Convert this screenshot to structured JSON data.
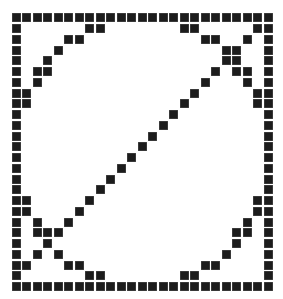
{
  "title": "Pixel grid pattern",
  "grid": {
    "cols": 25,
    "rows": 26,
    "origin_x": 11.7,
    "origin_y": 13.3,
    "pitch_x": 10.5,
    "pitch_y": 10.75,
    "cell_color": "#1c1c1c",
    "background": "#ffffff",
    "filled": [
      [
        0,
        1,
        2,
        3,
        4,
        5,
        6,
        7,
        8,
        9,
        10,
        11,
        12,
        13,
        14,
        15,
        16,
        17,
        18,
        19,
        20,
        21,
        22,
        23,
        24
      ],
      [
        0,
        7,
        8,
        16,
        17,
        23,
        24
      ],
      [
        0,
        5,
        6,
        18,
        19,
        22,
        24
      ],
      [
        0,
        4,
        20,
        21,
        24
      ],
      [
        0,
        3,
        20,
        21,
        24
      ],
      [
        0,
        2,
        3,
        19,
        21,
        22,
        24
      ],
      [
        0,
        2,
        18,
        22,
        24
      ],
      [
        0,
        1,
        17,
        23,
        24
      ],
      [
        0,
        1,
        16,
        23,
        24
      ],
      [
        0,
        15,
        24
      ],
      [
        0,
        14,
        24
      ],
      [
        0,
        13,
        24
      ],
      [
        0,
        12,
        24
      ],
      [
        0,
        11,
        24
      ],
      [
        0,
        10,
        24
      ],
      [
        0,
        9,
        24
      ],
      [
        0,
        8,
        24
      ],
      [
        0,
        1,
        7,
        23,
        24
      ],
      [
        0,
        1,
        6,
        23,
        24
      ],
      [
        0,
        2,
        5,
        22,
        24
      ],
      [
        0,
        2,
        3,
        4,
        21,
        22,
        24
      ],
      [
        0,
        3,
        21,
        24
      ],
      [
        0,
        2,
        4,
        20,
        24
      ],
      [
        0,
        1,
        5,
        6,
        18,
        19,
        24
      ],
      [
        0,
        7,
        8,
        16,
        17,
        24
      ],
      [
        0,
        1,
        2,
        3,
        4,
        5,
        6,
        7,
        8,
        9,
        10,
        11,
        12,
        13,
        14,
        15,
        16,
        17,
        18,
        19,
        20,
        21,
        22,
        23,
        24
      ]
    ]
  }
}
